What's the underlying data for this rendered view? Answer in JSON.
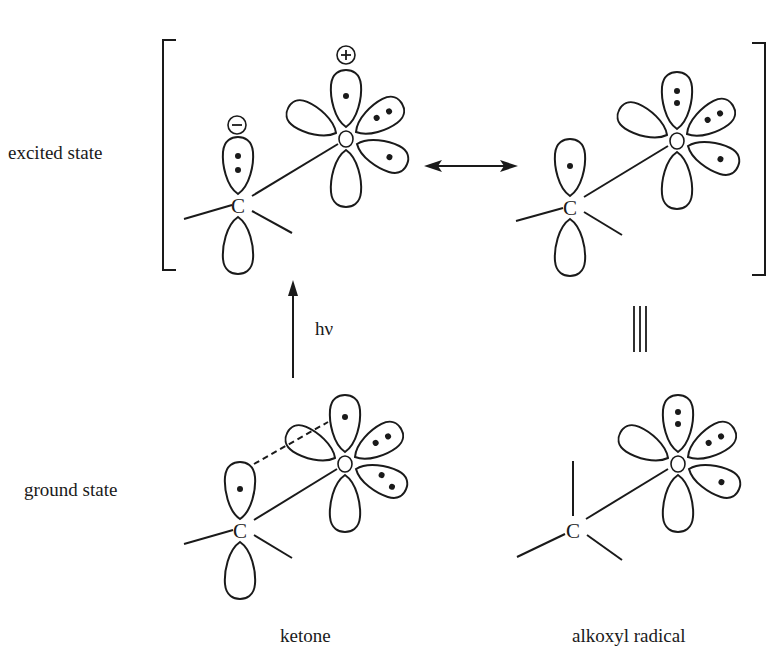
{
  "rows": {
    "excited_label": "excited state",
    "ground_label": "ground state"
  },
  "columns": {
    "left_label": "ketone",
    "right_label": "alkoxyl radical"
  },
  "arrows": {
    "photon_label": "hν",
    "resonance": "double-headed-arrow",
    "equivalence": "triple-bar"
  },
  "atoms": {
    "carbon": "C",
    "oxygen": "O"
  },
  "charges": {
    "negative": "−",
    "positive": "+"
  },
  "structures": [
    {
      "id": "excited-left",
      "carbon_lobe_electrons": 2,
      "carbon_charge": "negative",
      "oxygen_top_electrons": 1,
      "oxygen_charge": "positive",
      "oxygen_upper_right_electrons": 2,
      "oxygen_lower_right_electrons": 1
    },
    {
      "id": "excited-right",
      "carbon_lobe_electrons": 1,
      "oxygen_top_electrons": 2,
      "oxygen_upper_right_electrons": 2,
      "oxygen_lower_right_electrons": 1
    },
    {
      "id": "ground-ketone",
      "carbon_lobe_electrons": 1,
      "oxygen_top_electrons": 1,
      "oxygen_upper_right_electrons": 2,
      "oxygen_lower_right_electrons": 2,
      "pi_overlap": "dashed"
    },
    {
      "id": "ground-alkoxyl",
      "carbon_lobe_electrons": 0,
      "oxygen_top_electrons": 2,
      "oxygen_upper_right_electrons": 2,
      "oxygen_lower_right_electrons": 1
    }
  ]
}
